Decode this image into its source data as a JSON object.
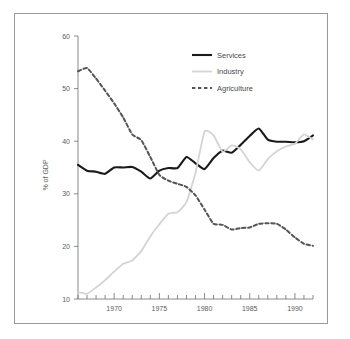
{
  "chart_data": {
    "type": "line",
    "title": "",
    "subtitle": "",
    "xlabel": "",
    "ylabel": "% of GDP",
    "xlim": [
      1966,
      1992
    ],
    "ylim": [
      10,
      60
    ],
    "grid": false,
    "legend_position": "top-center-right",
    "y_ticks": [
      10,
      20,
      30,
      40,
      50,
      60
    ],
    "y_tick_labels": [
      "10",
      "20",
      "30",
      "40",
      "50",
      "60"
    ],
    "x_ticks": [
      1966,
      1967,
      1968,
      1969,
      1970,
      1971,
      1972,
      1973,
      1974,
      1975,
      1976,
      1977,
      1978,
      1979,
      1980,
      1981,
      1982,
      1983,
      1984,
      1985,
      1986,
      1987,
      1988,
      1989,
      1990,
      1991,
      1992
    ],
    "x_tick_labels": [
      "1970",
      "1975",
      "1980",
      "1985",
      "1990"
    ],
    "x_labeled_ticks": [
      1970,
      1975,
      1980,
      1985,
      1990
    ],
    "x": [
      1966,
      1967,
      1968,
      1969,
      1970,
      1971,
      1972,
      1973,
      1974,
      1975,
      1976,
      1977,
      1978,
      1979,
      1980,
      1981,
      1982,
      1983,
      1984,
      1985,
      1986,
      1987,
      1988,
      1989,
      1990,
      1991,
      1992
    ],
    "series": [
      {
        "name": "Services",
        "style": "solid",
        "color": "#1a1a1a",
        "width": 2.1,
        "values": [
          35.5,
          34.4,
          34.2,
          33.8,
          35.0,
          35.0,
          35.1,
          34.2,
          32.9,
          34.4,
          34.9,
          34.9,
          37.0,
          35.8,
          34.7,
          36.8,
          38.2,
          37.8,
          39.3,
          41.0,
          42.4,
          40.3,
          39.9,
          39.9,
          39.8,
          40.0,
          41.1
        ]
      },
      {
        "name": "Industry",
        "style": "solid",
        "color": "#d4d4d4",
        "width": 1.8,
        "values": [
          11.3,
          11.0,
          12.2,
          13.6,
          15.2,
          16.7,
          17.3,
          19.1,
          21.9,
          24.2,
          26.2,
          26.5,
          28.4,
          34.0,
          41.8,
          41.1,
          38.0,
          39.2,
          38.5,
          36.0,
          34.4,
          36.6,
          38.1,
          39.0,
          39.5,
          41.3,
          40.3
        ]
      },
      {
        "name": "Agriculture",
        "style": "dashed",
        "color": "#555555",
        "width": 2.0,
        "values": [
          53.3,
          53.9,
          51.9,
          49.6,
          47.2,
          44.5,
          41.3,
          40.2,
          37.0,
          33.6,
          32.5,
          31.9,
          31.3,
          29.7,
          27.0,
          24.3,
          24.1,
          23.2,
          23.5,
          23.6,
          24.3,
          24.4,
          24.3,
          23.2,
          21.7,
          20.5,
          20.1
        ]
      }
    ]
  },
  "legend": {
    "items": [
      {
        "label": "Services"
      },
      {
        "label": "Industry"
      },
      {
        "label": "Agriculture"
      }
    ]
  },
  "axes": {
    "y_axis_title": "% of GDP"
  }
}
